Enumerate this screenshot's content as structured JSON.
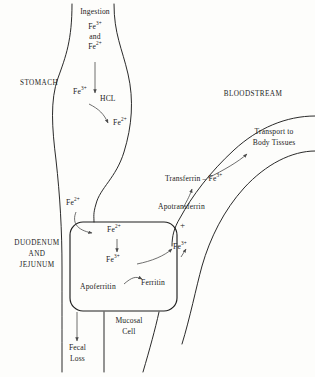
{
  "diagram": {
    "background_color": "#fdfdfb",
    "line_color": "#1f1f1f",
    "arrow_color": "#4a4a4a"
  },
  "regions": {
    "stomach": "STOMACH",
    "bloodstream": "BLOODSTREAM",
    "intestine_line1": "DUODENUM",
    "intestine_line2": "AND",
    "intestine_line3": "JEJUNUM",
    "mucosal_line1": "Mucosal",
    "mucosal_line2": "Cell"
  },
  "stomach_pathway": {
    "ingestion": "Ingestion",
    "ingested_ion_1": "Fe",
    "ingested_ion_1_charge": "3+",
    "conjunction": "and",
    "ingested_ion_2": "Fe",
    "ingested_ion_2_charge": "2+",
    "ferric_label": "Fe",
    "ferric_charge": "3+",
    "reagent": "HCL",
    "ferrous_label": "Fe",
    "ferrous_charge": "2+"
  },
  "lumen": {
    "absorbed_ion": "Fe",
    "absorbed_ion_charge": "2+",
    "fecal_line1": "Fecal",
    "fecal_line2": "Loss"
  },
  "mucosal_cell": {
    "entry_ion": "Fe",
    "entry_ion_charge": "2+",
    "oxidized_ion": "Fe",
    "oxidized_ion_charge": "3+",
    "apoferritin": "Apoferritin",
    "ferritin": "Ferritin"
  },
  "blood_pathway": {
    "exported_ion": "Fe",
    "exported_ion_charge": "3+",
    "apotransferrin": "Apotransferrin",
    "plus_sign": "+",
    "transferrin_complex": "Transferrin – Fe",
    "transferrin_complex_charge": "3+",
    "transport_line1": "Transport to",
    "transport_line2": "Body Tissues"
  }
}
